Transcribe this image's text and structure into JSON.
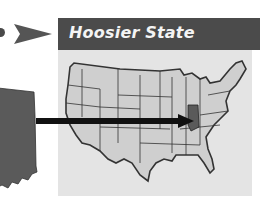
{
  "banner": {
    "title": "Hoosier State"
  },
  "diagram": {
    "highlighted_state": "Indiana",
    "map_subject": "United States map",
    "silhouette_subject": "Indiana state silhouette"
  },
  "colors": {
    "banner_bg": "#4b4b4b",
    "banner_text": "#f4f4f4",
    "panel_bg": "#e4e4e4",
    "state_fill": "#cfcfcf",
    "highlight_fill": "#5a5a5a",
    "arrow": "#111111"
  }
}
